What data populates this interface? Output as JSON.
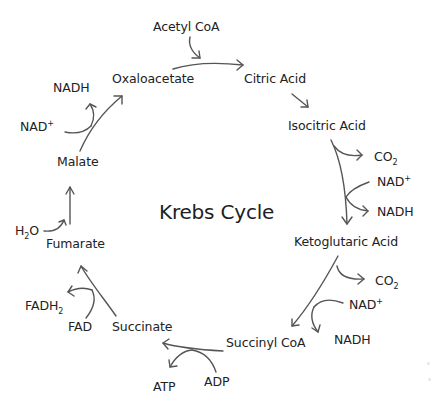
{
  "diagram": {
    "title": "Krebs Cycle",
    "stroke_color": "#555555",
    "text_color": "#222222",
    "background": "#ffffff",
    "intermediates": [
      {
        "id": "oxaloacetate",
        "label": "Oxaloacetate"
      },
      {
        "id": "citric",
        "label": "Citric Acid"
      },
      {
        "id": "isocitric",
        "label": "Isocitric Acid"
      },
      {
        "id": "ketoglutaric",
        "label": "Ketoglutaric Acid"
      },
      {
        "id": "succinylcoa",
        "label": "Succinyl CoA"
      },
      {
        "id": "succinate",
        "label": "Succinate"
      },
      {
        "id": "fumarate",
        "label": "Fumarate"
      },
      {
        "id": "malate",
        "label": "Malate"
      }
    ],
    "inputs_outputs": {
      "acetyl_coa": "Acetyl CoA",
      "co2_1": {
        "base": "CO",
        "sub": "2"
      },
      "nad_1": {
        "base": "NAD",
        "sup": "+"
      },
      "nadh_1": "NADH",
      "co2_2": {
        "base": "CO",
        "sub": "2"
      },
      "nad_2": {
        "base": "NAD",
        "sup": "+"
      },
      "nadh_2": "NADH",
      "adp": "ADP",
      "atp": "ATP",
      "fad": "FAD",
      "fadh2": {
        "base": "FADH",
        "sub": "2"
      },
      "h2o": {
        "pre": "H",
        "sub": "2",
        "post": "O"
      },
      "nad_3": {
        "base": "NAD",
        "sup": "+"
      },
      "nadh_3": "NADH"
    },
    "steps": [
      {
        "from": "Oxaloacetate",
        "to": "Citric Acid",
        "adds": [
          "Acetyl CoA"
        ]
      },
      {
        "from": "Citric Acid",
        "to": "Isocitric Acid"
      },
      {
        "from": "Isocitric Acid",
        "to": "Ketoglutaric Acid",
        "releases": [
          "CO2",
          "NADH"
        ],
        "consumes": [
          "NAD+"
        ]
      },
      {
        "from": "Ketoglutaric Acid",
        "to": "Succinyl CoA",
        "releases": [
          "CO2",
          "NADH"
        ],
        "consumes": [
          "NAD+"
        ]
      },
      {
        "from": "Succinyl CoA",
        "to": "Succinate",
        "consumes": [
          "ADP"
        ],
        "releases": [
          "ATP"
        ]
      },
      {
        "from": "Succinate",
        "to": "Fumarate",
        "consumes": [
          "FAD"
        ],
        "releases": [
          "FADH2"
        ]
      },
      {
        "from": "Fumarate",
        "to": "Malate",
        "consumes": [
          "H2O"
        ]
      },
      {
        "from": "Malate",
        "to": "Oxaloacetate",
        "consumes": [
          "NAD+"
        ],
        "releases": [
          "NADH"
        ]
      }
    ]
  }
}
